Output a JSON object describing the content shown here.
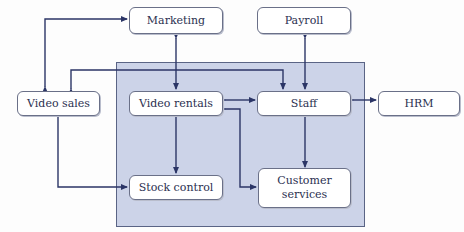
{
  "diagram": {
    "type": "context-diagram",
    "colors": {
      "region_fill": "#ccd3e8",
      "line": "#2b3566",
      "node_border": "#6a7088",
      "text": "#2b3050"
    },
    "nodes": {
      "marketing": {
        "label": "Marketing"
      },
      "payroll": {
        "label": "Payroll"
      },
      "video_sales": {
        "label": "Video sales"
      },
      "video_rentals": {
        "label": "Video rentals"
      },
      "staff": {
        "label": "Staff"
      },
      "hrm": {
        "label": "HRM"
      },
      "stock_control": {
        "label": "Stock control"
      },
      "customer_services": {
        "label": "Customer services"
      }
    },
    "edges": [
      {
        "from": "Video sales",
        "to": "Marketing",
        "direction": "both"
      },
      {
        "from": "Marketing",
        "to": "Video rentals",
        "direction": "both"
      },
      {
        "from": "Payroll",
        "to": "Staff",
        "direction": "both"
      },
      {
        "from": "Video rentals",
        "to": "Staff",
        "direction": "both"
      },
      {
        "from": "Staff",
        "to": "HRM",
        "direction": "both"
      },
      {
        "from": "Staff",
        "to": "Video sales",
        "direction": "both"
      },
      {
        "from": "Video rentals",
        "to": "Stock control",
        "direction": "both"
      },
      {
        "from": "Video sales",
        "to": "Stock control",
        "direction": "both"
      },
      {
        "from": "Video rentals",
        "to": "Customer services",
        "direction": "both"
      },
      {
        "from": "Staff",
        "to": "Customer services",
        "direction": "both"
      }
    ]
  }
}
